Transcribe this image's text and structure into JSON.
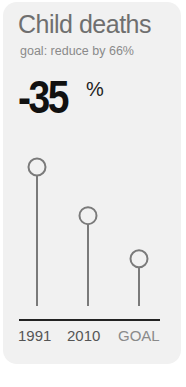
{
  "title": "Child deaths",
  "subtitle": "goal: reduce by 66%",
  "headline": {
    "value": "-35",
    "unit": "%"
  },
  "chart_data": {
    "type": "lollipop",
    "title": "Child deaths",
    "subtitle": "goal: reduce by 66%",
    "categories": [
      "1991",
      "2010",
      "GOAL"
    ],
    "values": [
      100,
      65,
      34
    ],
    "ylabel": "",
    "xlabel": "",
    "ylim": [
      0,
      100
    ],
    "grid": false,
    "annotation": "-35%"
  },
  "labels": [
    "1991",
    "2010",
    "GOAL"
  ],
  "colors": {
    "stem": "#7a7a7a",
    "axis": "#222222",
    "card": "#f1f1f1"
  }
}
